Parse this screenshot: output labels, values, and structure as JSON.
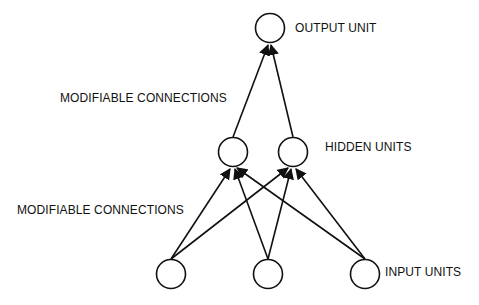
{
  "labels": {
    "output": "OUTPUT UNIT",
    "hidden": "HIDDEN UNITS",
    "input": "INPUT UNITS",
    "upper_connections": "MODIFIABLE CONNECTIONS",
    "lower_connections": "MODIFIABLE CONNECTIONS"
  },
  "layers": {
    "output": {
      "count": 1
    },
    "hidden": {
      "count": 2
    },
    "input": {
      "count": 3
    }
  },
  "colors": {
    "stroke": "#111111",
    "background": "#ffffff"
  }
}
